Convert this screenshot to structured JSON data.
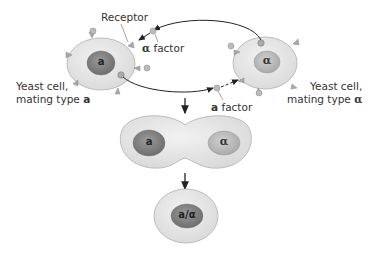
{
  "diagram": {
    "labels": {
      "receptor": "Receptor",
      "alpha_factor_symbol": "α",
      "alpha_factor_text": " factor",
      "a_factor_symbol": "a",
      "a_factor_text": " factor",
      "cell_a_line1": "Yeast cell,",
      "cell_a_line2": "mating type ",
      "cell_a_type": "a",
      "cell_alpha_line1": "Yeast cell,",
      "cell_alpha_line2": "mating type ",
      "cell_alpha_type": "α"
    },
    "nuclei": {
      "cell_a": "a",
      "cell_alpha": "α",
      "fusing_a": "a",
      "fusing_alpha": "α",
      "diploid": "a/α"
    },
    "colors": {
      "cytoplasm": "#e3e3e3",
      "cell_outline": "#bdbdbd",
      "nucleus_dark": "#8c8c8c",
      "nucleus_light": "#c4c4c4",
      "receptor": "#a8a8a8",
      "arrow": "#222222"
    }
  }
}
